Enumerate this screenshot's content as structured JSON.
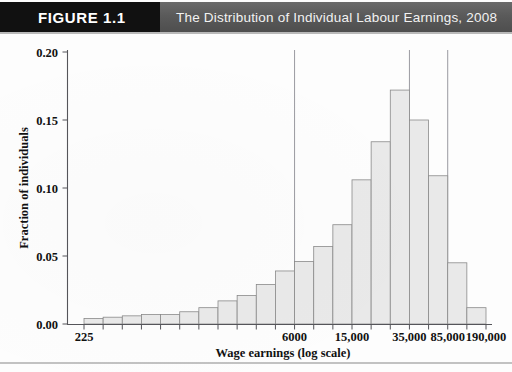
{
  "header": {
    "badge_label": "FIGURE 1.1",
    "title": "The Distribution of Individual Labour Earnings, 2008",
    "badge_color": "#111111",
    "bar_color": "#5b5b5b",
    "title_color": "#f2f2f2"
  },
  "chart_data": {
    "type": "bar",
    "title": "The Distribution of Individual Labour Earnings, 2008",
    "xlabel": "Wage earnings (log scale)",
    "ylabel": "Fraction of individuals",
    "ylim": [
      0.0,
      0.2
    ],
    "yticks": [
      "0.00",
      "0.05",
      "0.10",
      "0.15",
      "0.20"
    ],
    "ytick_values": [
      0.0,
      0.05,
      0.1,
      0.15,
      0.2
    ],
    "xtick_labels": [
      "225",
      "6000",
      "15,000",
      "35,000",
      "85,000",
      "190,000"
    ],
    "xtick_values": [
      225,
      6000,
      15000,
      35000,
      85000,
      190000
    ],
    "grid": false,
    "legend": "none",
    "bar_fill": "#e9e9e9",
    "bar_stroke": "#8a8a8a",
    "reference_lines": [
      6000,
      35000,
      85000
    ],
    "note": "Histogram of individual labour earnings on a log wage scale; 21 bins.",
    "bins": [
      {
        "label": "225",
        "value": 0.004
      },
      {
        "label": "bin2",
        "value": 0.005
      },
      {
        "label": "bin3",
        "value": 0.006
      },
      {
        "label": "bin4",
        "value": 0.007
      },
      {
        "label": "bin5",
        "value": 0.007
      },
      {
        "label": "bin6",
        "value": 0.009
      },
      {
        "label": "bin7",
        "value": 0.012
      },
      {
        "label": "bin8",
        "value": 0.017
      },
      {
        "label": "bin9",
        "value": 0.021
      },
      {
        "label": "bin10",
        "value": 0.029
      },
      {
        "label": "6000",
        "value": 0.039
      },
      {
        "label": "bin12",
        "value": 0.046
      },
      {
        "label": "bin13",
        "value": 0.057
      },
      {
        "label": "15,000",
        "value": 0.073
      },
      {
        "label": "bin15",
        "value": 0.106
      },
      {
        "label": "bin16",
        "value": 0.134
      },
      {
        "label": "35,000",
        "value": 0.172
      },
      {
        "label": "bin18",
        "value": 0.15
      },
      {
        "label": "85,000",
        "value": 0.109
      },
      {
        "label": "bin20",
        "value": 0.045
      },
      {
        "label": "190,000",
        "value": 0.012
      }
    ],
    "values": [
      0.004,
      0.005,
      0.006,
      0.007,
      0.007,
      0.009,
      0.012,
      0.017,
      0.021,
      0.029,
      0.039,
      0.046,
      0.057,
      0.073,
      0.106,
      0.134,
      0.172,
      0.15,
      0.109,
      0.045,
      0.012
    ],
    "categories": [
      "1",
      "2",
      "3",
      "4",
      "5",
      "6",
      "7",
      "8",
      "9",
      "10",
      "11",
      "12",
      "13",
      "14",
      "15",
      "16",
      "17",
      "18",
      "19",
      "20",
      "21"
    ]
  }
}
